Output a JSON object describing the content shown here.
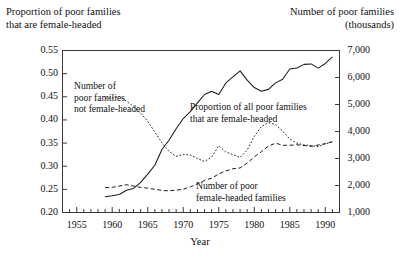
{
  "titles": {
    "left_axis_title_line1": "Proportion of poor families",
    "left_axis_title_line2": "that are female-headed",
    "right_axis_title_line1": "Number of poor families",
    "right_axis_title_line2": "(thousands)",
    "x_axis_title": "Year"
  },
  "annotations": {
    "not_female_headed_l1": "Number of",
    "not_female_headed_l2": "poor families",
    "not_female_headed_l3": "not female-headed",
    "proportion_all_l1": "Proportion of all poor families",
    "proportion_all_l2": "that are female-headed",
    "number_female_headed_l1": "Number of poor",
    "number_female_headed_l2": "female-headed families"
  },
  "axes": {
    "left_ticks": [
      "0.55",
      "0.50",
      "0.45",
      "0.40",
      "0.35",
      "0.30",
      "0.25",
      "0.20"
    ],
    "right_ticks": [
      "7,000",
      "6,000",
      "5,000",
      "4,000",
      "3,000",
      "2,000",
      "1,000"
    ],
    "x_ticks": [
      "1955",
      "1960",
      "1965",
      "1970",
      "1975",
      "1980",
      "1985",
      "1990"
    ]
  },
  "chart_data": {
    "type": "line",
    "title": "",
    "xlabel": "Year",
    "ylabel": "Proportion of poor families that are female-headed",
    "ylabel_right": "Number of poor families (thousands)",
    "grid": false,
    "legend": "inline-annotations",
    "xlim": [
      1953,
      1992
    ],
    "ylim_left": [
      0.2,
      0.55
    ],
    "ylim_right": [
      1000,
      7000
    ],
    "x": [
      1959,
      1960,
      1961,
      1962,
      1963,
      1964,
      1965,
      1966,
      1967,
      1968,
      1969,
      1970,
      1971,
      1972,
      1973,
      1974,
      1975,
      1976,
      1977,
      1978,
      1979,
      1980,
      1981,
      1982,
      1983,
      1984,
      1985,
      1986,
      1987,
      1988,
      1989,
      1990,
      1991
    ],
    "series": [
      {
        "name": "Proportion of all poor families that are female-headed",
        "axis": "left",
        "style": "solid",
        "units": "proportion",
        "values": [
          0.234,
          0.236,
          0.239,
          0.248,
          0.252,
          0.265,
          0.283,
          0.302,
          0.336,
          0.356,
          0.381,
          0.403,
          0.418,
          0.437,
          0.455,
          0.462,
          0.455,
          0.48,
          0.493,
          0.506,
          0.486,
          0.47,
          0.462,
          0.466,
          0.48,
          0.488,
          0.51,
          0.512,
          0.52,
          0.521,
          0.512,
          0.522,
          0.536
        ]
      },
      {
        "name": "Number of poor families not female-headed",
        "axis": "right",
        "style": "dotted",
        "units": "thousands",
        "values": [
          5230,
          5240,
          5300,
          5120,
          4930,
          4680,
          4380,
          3980,
          3580,
          3260,
          3080,
          3150,
          3130,
          3000,
          2890,
          3060,
          3470,
          3240,
          3140,
          3040,
          3310,
          3820,
          4180,
          4330,
          4260,
          4010,
          3720,
          3570,
          3500,
          3480,
          3440,
          3540,
          3620
        ]
      },
      {
        "name": "Number of poor female-headed families",
        "axis": "right",
        "style": "dashed",
        "units": "thousands",
        "values": [
          1920,
          1930,
          1980,
          2030,
          1980,
          1930,
          1900,
          1860,
          1820,
          1800,
          1830,
          1860,
          1950,
          2060,
          2190,
          2270,
          2430,
          2540,
          2620,
          2650,
          2830,
          3060,
          3250,
          3460,
          3570,
          3490,
          3490,
          3510,
          3480,
          3450,
          3500,
          3550,
          3620
        ]
      }
    ]
  }
}
